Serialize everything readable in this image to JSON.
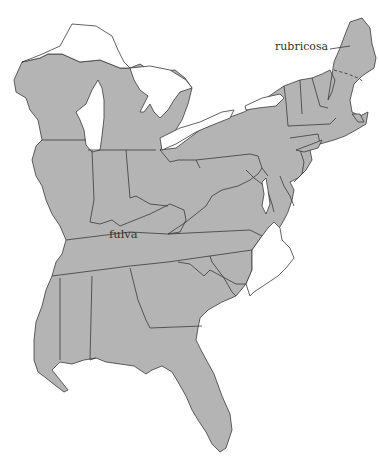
{
  "map": {
    "region": "Eastern United States",
    "colors": {
      "range_fill": "#b4b4b4",
      "background": "#ffffff",
      "border": "#3a3a3a"
    },
    "labels": [
      {
        "id": "rubricosa",
        "text": "rubricosa"
      },
      {
        "id": "fulva",
        "text": "fulva"
      }
    ]
  }
}
